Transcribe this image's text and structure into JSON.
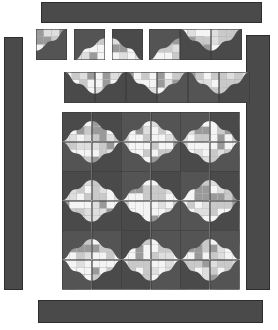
{
  "canvas": {
    "width": 278,
    "height": 330,
    "background": "#ffffff"
  },
  "palette": {
    "dark": "#4a4a4a",
    "dark_alt": "#545454",
    "border_line": "#2e2e2e",
    "mid_gray": "#9a9a9a",
    "light_gray": "#c9c9c9",
    "pale_gray": "#dedede",
    "white": "#f4f4f4",
    "outline": "#3b3b3b"
  },
  "borders": [
    {
      "name": "top-border-strip",
      "x": 41,
      "y": 2,
      "w": 221,
      "h": 21,
      "color": "#4a4a4a"
    },
    {
      "name": "left-border-strip",
      "x": 4,
      "y": 37,
      "w": 19,
      "h": 253,
      "color": "#4a4a4a"
    },
    {
      "name": "right-border-strip",
      "x": 246,
      "y": 35,
      "w": 24,
      "h": 255,
      "color": "#4a4a4a"
    },
    {
      "name": "bottom-border-strip",
      "x": 38,
      "y": 300,
      "w": 225,
      "h": 23,
      "color": "#4a4a4a"
    }
  ],
  "sample_row_top": {
    "label": "single-block-samples",
    "y": 29,
    "size": 31,
    "blocks": [
      {
        "x": 36,
        "orient": "br",
        "dark": "bottom-left"
      },
      {
        "x": 74,
        "orient": "tl",
        "dark": "upper-left"
      },
      {
        "x": 112,
        "orient": "tr",
        "dark": "upper-right"
      },
      {
        "x": 149,
        "orient": "tl",
        "dark": "upper-left"
      },
      {
        "x": 180,
        "orient": "bl",
        "dark": "lower-right"
      },
      {
        "x": 211,
        "orient": "br",
        "dark": "lower-left"
      }
    ]
  },
  "sample_row_strip": {
    "label": "two-block-unit-strip",
    "y": 72,
    "size": 31,
    "blocks": [
      {
        "x": 64,
        "orient": "bl"
      },
      {
        "x": 95,
        "orient": "br"
      },
      {
        "x": 126,
        "orient": "bl"
      },
      {
        "x": 157,
        "orient": "br"
      },
      {
        "x": 188,
        "orient": "bl"
      },
      {
        "x": 219,
        "orient": "br"
      }
    ]
  },
  "main_grid": {
    "label": "main-quilt-grid",
    "x": 62,
    "y": 112,
    "cols": 6,
    "rows": 6,
    "cell": 29.6,
    "orientations": [
      [
        "tl",
        "tr",
        "tl",
        "tr",
        "tl",
        "tr"
      ],
      [
        "bl",
        "br",
        "bl",
        "br",
        "bl",
        "br"
      ],
      [
        "tl",
        "tr",
        "tl",
        "tr",
        "tl",
        "tr"
      ],
      [
        "bl",
        "br",
        "bl",
        "br",
        "bl",
        "br"
      ],
      [
        "tl",
        "tr",
        "tl",
        "tr",
        "tl",
        "tr"
      ],
      [
        "bl",
        "br",
        "bl",
        "br",
        "bl",
        "br"
      ]
    ],
    "patch_seed": 7
  },
  "chart_data": {
    "type": "table",
    "categories": [
      "top-border",
      "left-border",
      "right-border",
      "bottom-border",
      "single-samples",
      "strip-samples",
      "main-grid"
    ],
    "values": [
      1,
      1,
      1,
      1,
      6,
      6,
      36
    ]
  }
}
